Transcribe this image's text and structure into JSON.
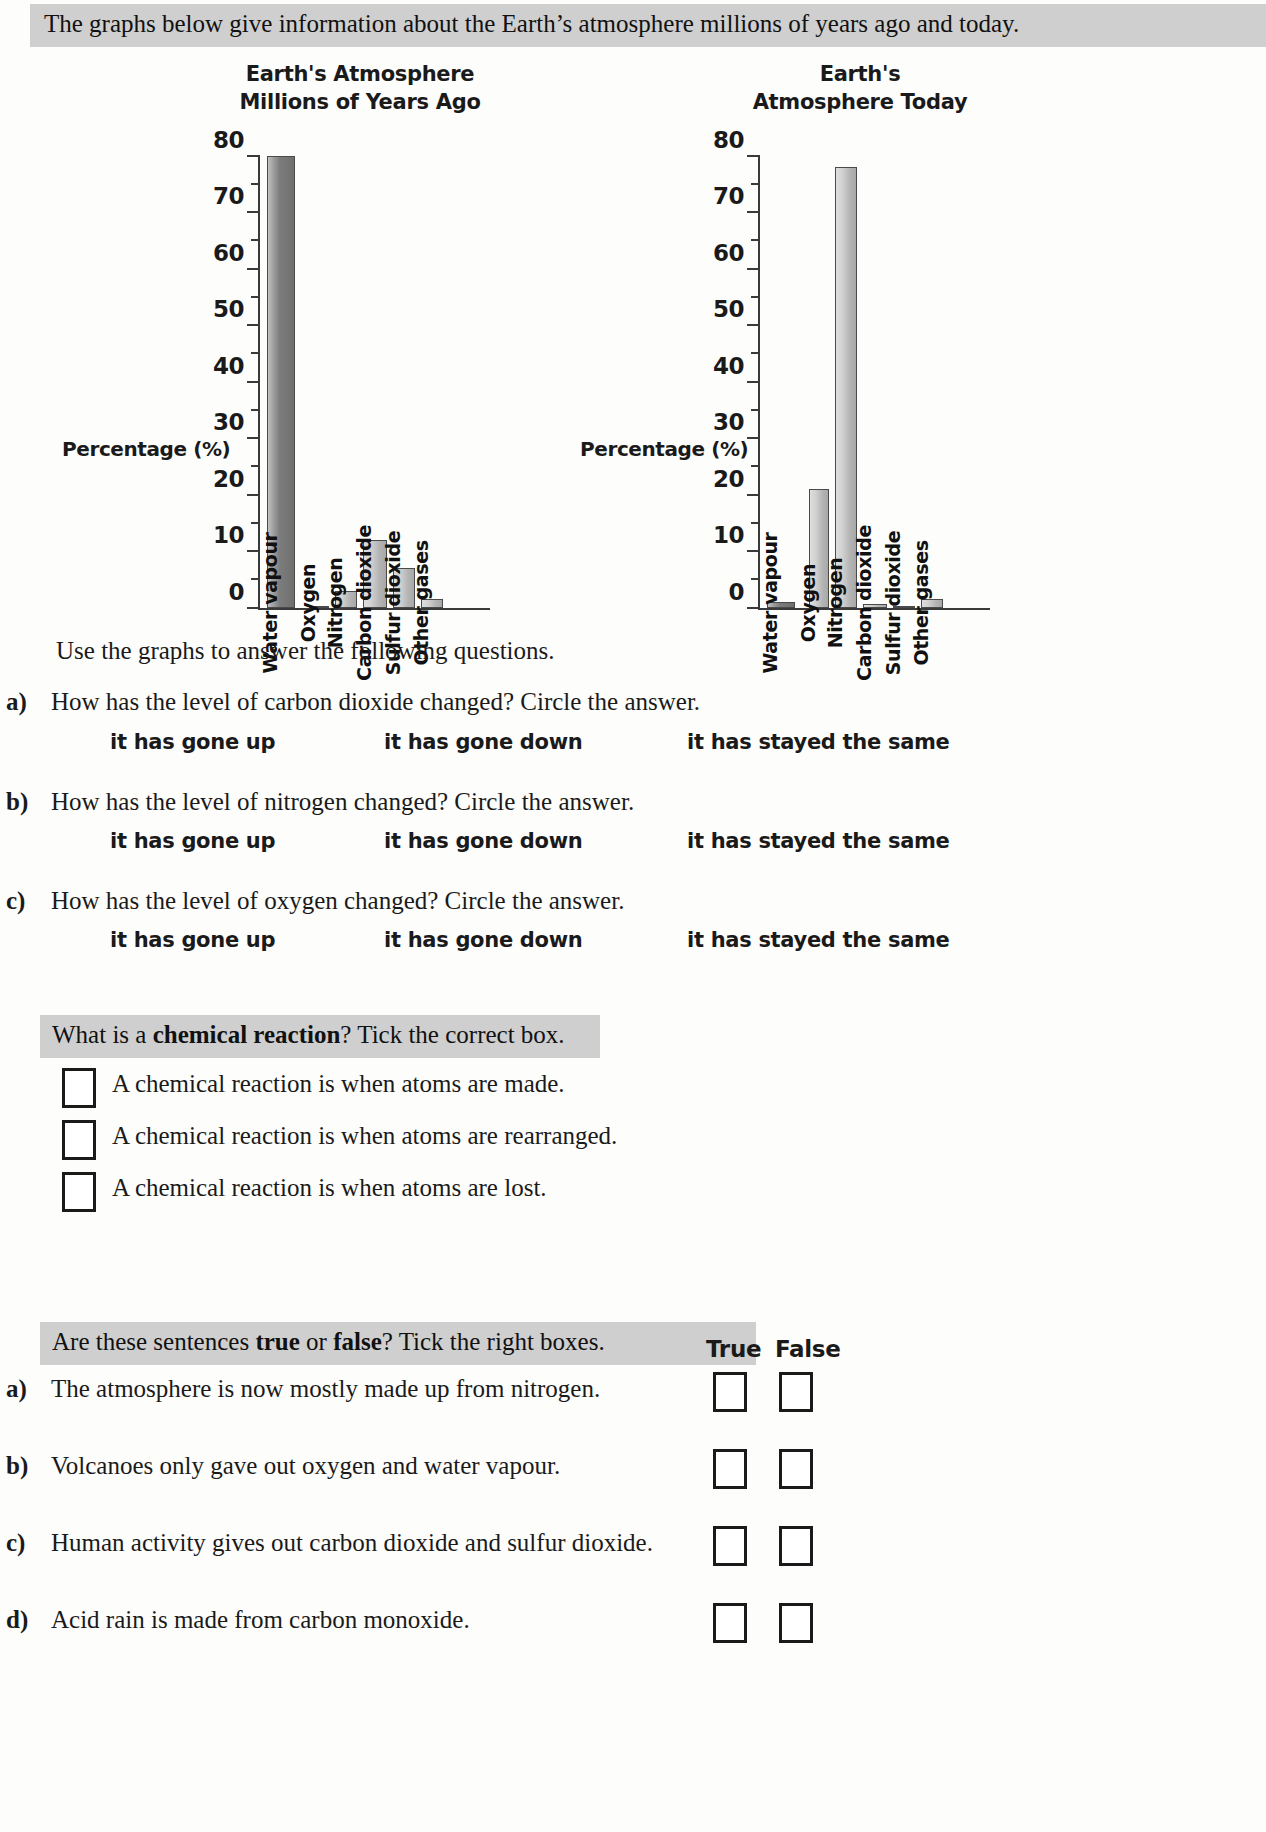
{
  "header": {
    "intro": "The graphs below give information about the Earth’s atmosphere millions of years ago and today."
  },
  "charts": {
    "left_title": "Earth's Atmosphere\nMillions of Years Ago",
    "right_title": "Earth's\nAtmosphere Today",
    "axis_label": "Percentage (%)"
  },
  "chart_data": [
    {
      "type": "bar",
      "title": "Earth's Atmosphere Millions of Years Ago",
      "xlabel": "",
      "ylabel": "Percentage (%)",
      "ylim": [
        0,
        80
      ],
      "yticks": [
        0,
        10,
        20,
        30,
        40,
        50,
        60,
        70,
        80
      ],
      "ytick_labels": [
        "0",
        "10",
        "20",
        "30",
        "40",
        "50",
        "60",
        "70",
        "80"
      ],
      "minor_ticks": [
        5,
        15,
        25,
        35,
        45,
        55,
        65,
        75
      ],
      "grid": false,
      "legend": "none",
      "categories": [
        "Water vapour",
        "Oxygen",
        "Nitrogen",
        "Carbon dioxide",
        "Sulfur dioxide",
        "Other gases"
      ],
      "values": [
        80,
        0,
        3,
        12,
        7,
        1.5
      ]
    },
    {
      "type": "bar",
      "title": "Earth's Atmosphere Today",
      "xlabel": "",
      "ylabel": "Percentage (%)",
      "ylim": [
        0,
        80
      ],
      "yticks": [
        0,
        10,
        20,
        30,
        40,
        50,
        60,
        70,
        80
      ],
      "ytick_labels": [
        "0",
        "10",
        "20",
        "30",
        "40",
        "50",
        "60",
        "70",
        "80"
      ],
      "minor_ticks": [
        5,
        15,
        25,
        35,
        45,
        55,
        65,
        75
      ],
      "grid": false,
      "legend": "none",
      "categories": [
        "Water vapour",
        "Oxygen",
        "Nitrogen",
        "Carbon dioxide",
        "Sulfur dioxide",
        "Other gases"
      ],
      "values": [
        1,
        21,
        78,
        0.7,
        0.3,
        1.5
      ]
    }
  ],
  "instructions": "Use the graphs to answer the following questions.",
  "circle_questions": [
    {
      "marker": "a)",
      "prompt": "How has the level of carbon dioxide changed?  Circle the answer.",
      "options": [
        "it has gone up",
        "it has gone down",
        "it has stayed the same"
      ]
    },
    {
      "marker": "b)",
      "prompt": "How has the level of nitrogen changed?  Circle the answer.",
      "options": [
        "it has gone up",
        "it has gone down",
        "it has stayed the same"
      ]
    },
    {
      "marker": "c)",
      "prompt": "How has the level of oxygen changed?  Circle the answer.",
      "options": [
        "it has gone up",
        "it has gone down",
        "it has stayed the same"
      ]
    }
  ],
  "chemical_section": {
    "banner_prefix": "What is a ",
    "banner_bold": "chemical reaction",
    "banner_suffix": "?  Tick the correct box.",
    "options": [
      "A chemical reaction is when atoms are made.",
      "A chemical reaction is when atoms are rearranged.",
      "A chemical reaction is when atoms are lost."
    ]
  },
  "truefalse_section": {
    "banner_prefix": "Are these sentences ",
    "banner_bold1": "true",
    "banner_mid": " or ",
    "banner_bold2": "false",
    "banner_suffix": "?  Tick the right boxes.",
    "col_true": "True",
    "col_false": "False",
    "rows": [
      {
        "marker": "a)",
        "text": "The atmosphere is now mostly made up from nitrogen."
      },
      {
        "marker": "b)",
        "text": "Volcanoes only gave out oxygen and water vapour."
      },
      {
        "marker": "c)",
        "text": "Human activity gives out carbon dioxide and sulfur dioxide."
      },
      {
        "marker": "d)",
        "text": "Acid rain is made from carbon monoxide."
      }
    ]
  }
}
